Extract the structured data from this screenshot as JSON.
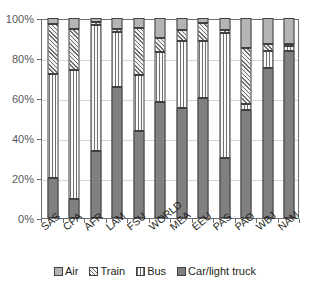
{
  "chart_data": {
    "type": "bar",
    "subtype": "stacked-100-percent-column",
    "title": "",
    "xlabel": "",
    "ylabel": "",
    "ylim": [
      0,
      100
    ],
    "yticks": [
      0,
      20,
      40,
      60,
      80,
      100
    ],
    "ytick_labels": [
      "0%",
      "20%",
      "40%",
      "60%",
      "80%",
      "100%"
    ],
    "grid": true,
    "legend_position": "bottom",
    "categories": [
      "SAS",
      "CPA",
      "AFR",
      "LAM",
      "FSU",
      "WORLD",
      "MEA",
      "EEU",
      "PAS",
      "PAO",
      "WBJ",
      "NAM"
    ],
    "series": [
      {
        "name": "Car/light truck",
        "pattern": "solid-dark-gray",
        "color": "#808080",
        "values": [
          20,
          9.5,
          33.5,
          65.5,
          43.5,
          58,
          55,
          60,
          30,
          54,
          75,
          83.5
        ]
      },
      {
        "name": "Bus",
        "pattern": "vertical-stripes",
        "color": "#fbfbfb",
        "values": [
          52,
          64.5,
          63,
          27.5,
          28,
          25,
          33.5,
          28.5,
          62.5,
          3,
          8.5,
          2.5
        ]
      },
      {
        "name": "Train",
        "pattern": "diagonal-hatch",
        "color": "#f2f2f2",
        "values": [
          25,
          20.5,
          1.5,
          1.5,
          23.5,
          7,
          5.5,
          9,
          1.5,
          28,
          3.5,
          1
        ]
      },
      {
        "name": "Air",
        "pattern": "solid-light-gray",
        "color": "#b4b4b4",
        "values": [
          3,
          5.5,
          2,
          5.5,
          5,
          10,
          6,
          2.5,
          6,
          15,
          13,
          13
        ]
      }
    ]
  },
  "legend": {
    "items": [
      {
        "label": "Air",
        "key": "air"
      },
      {
        "label": "Train",
        "key": "train"
      },
      {
        "label": "Bus",
        "key": "bus"
      },
      {
        "label": "Car/light truck",
        "key": "car"
      }
    ]
  },
  "colors": {
    "air": "#b4b4b4",
    "train": "#f2f2f2",
    "bus": "#fbfbfb",
    "car": "#808080",
    "axis": "#6d6e71",
    "grid": "#d6d6d6",
    "text": "#231f20"
  }
}
